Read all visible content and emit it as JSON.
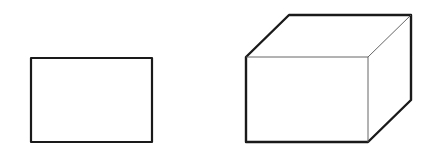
{
  "canvas": {
    "width": 427,
    "height": 163,
    "background": "#ffffff"
  },
  "colors": {
    "stroke": "#1a1a1a",
    "thin_stroke": "#555555"
  },
  "shapes": [
    {
      "type": "rectangle",
      "label": "2D rectangle",
      "x": 31,
      "y": 58,
      "width": 121,
      "height": 84
    },
    {
      "type": "cube",
      "label": "3D cube",
      "front": {
        "x": 246,
        "y": 57,
        "width": 122,
        "height": 85
      },
      "depth_offset": {
        "dx": 43,
        "dy": -42
      }
    }
  ]
}
